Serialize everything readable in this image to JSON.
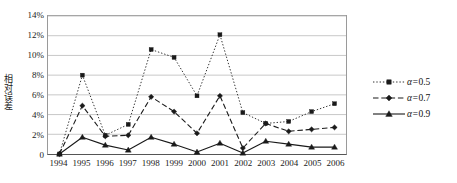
{
  "chart_data": {
    "type": "line",
    "title": "",
    "xlabel": "",
    "ylabel": "相对误差",
    "categories": [
      "1994",
      "1995",
      "1996",
      "1997",
      "1998",
      "1999",
      "2000",
      "2001",
      "2002",
      "2003",
      "2004",
      "2005",
      "2006"
    ],
    "ylim": [
      0,
      14
    ],
    "yticks": [
      0,
      2,
      4,
      6,
      8,
      10,
      12,
      14
    ],
    "ytick_labels": [
      "0",
      "2%",
      "4%",
      "6%",
      "8%",
      "10%",
      "12%",
      "14%"
    ],
    "grid": true,
    "legend_position": "right",
    "series": [
      {
        "name": "α=0.5",
        "marker": "square",
        "line_style": "dotted",
        "color": "#1a1a1a",
        "values": [
          0.0,
          8.0,
          1.9,
          3.0,
          10.6,
          9.8,
          5.9,
          12.1,
          4.2,
          3.1,
          3.3,
          4.3,
          5.1
        ]
      },
      {
        "name": "α=0.7",
        "marker": "diamond",
        "line_style": "dashed",
        "color": "#1a1a1a",
        "values": [
          0.0,
          4.9,
          1.8,
          1.9,
          5.8,
          4.3,
          2.1,
          5.9,
          0.6,
          3.1,
          2.3,
          2.5,
          2.7
        ]
      },
      {
        "name": "α=0.9",
        "marker": "triangle",
        "line_style": "solid",
        "color": "#1a1a1a",
        "values": [
          0.0,
          1.7,
          0.9,
          0.4,
          1.7,
          1.0,
          0.2,
          1.1,
          0.1,
          1.3,
          1.0,
          0.7,
          0.7
        ]
      }
    ]
  },
  "legend": {
    "items": [
      {
        "label": "α=0.5"
      },
      {
        "label": "α=0.7"
      },
      {
        "label": "α=0.9"
      }
    ]
  }
}
